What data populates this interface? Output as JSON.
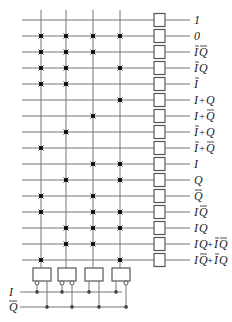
{
  "diagram": {
    "type": "crosspoint-array-function-generator",
    "columns": [
      "c0",
      "c1",
      "c2",
      "c3"
    ],
    "rows": [
      {
        "label": "1",
        "parts": [
          {
            "t": "1"
          }
        ],
        "cross": []
      },
      {
        "label": "0",
        "parts": [
          {
            "t": "0"
          }
        ],
        "cross": [
          0,
          1,
          2,
          3
        ]
      },
      {
        "label": "ĪQ̄",
        "parts": [
          {
            "t": "I",
            "bar": true
          },
          {
            "t": "Q",
            "bar": true
          }
        ],
        "cross": [
          0,
          1,
          2
        ]
      },
      {
        "label": "ĪQ",
        "parts": [
          {
            "t": "I",
            "bar": true
          },
          {
            "t": "Q"
          }
        ],
        "cross": [
          0,
          1,
          3
        ]
      },
      {
        "label": "Ī",
        "parts": [
          {
            "t": "I",
            "bar": true
          }
        ],
        "cross": [
          0,
          1
        ]
      },
      {
        "label": "I+Q",
        "parts": [
          {
            "t": "I"
          },
          {
            "t": "+"
          },
          {
            "t": "Q"
          }
        ],
        "cross": [
          3
        ]
      },
      {
        "label": "I+Q̄",
        "parts": [
          {
            "t": "I"
          },
          {
            "t": "+"
          },
          {
            "t": "Q",
            "bar": true
          }
        ],
        "cross": [
          2
        ]
      },
      {
        "label": "Ī+Q",
        "parts": [
          {
            "t": "I",
            "bar": true
          },
          {
            "t": "+"
          },
          {
            "t": "Q"
          }
        ],
        "cross": [
          1
        ]
      },
      {
        "label": "Ī+Q̄",
        "parts": [
          {
            "t": "I",
            "bar": true
          },
          {
            "t": "+"
          },
          {
            "t": "Q",
            "bar": true
          }
        ],
        "cross": [
          0
        ]
      },
      {
        "label": "I",
        "parts": [
          {
            "t": "I"
          }
        ],
        "cross": [
          2,
          3
        ]
      },
      {
        "label": "Q",
        "parts": [
          {
            "t": "Q"
          }
        ],
        "cross": [
          1,
          3
        ]
      },
      {
        "label": "Q̄",
        "parts": [
          {
            "t": "Q",
            "bar": true
          }
        ],
        "cross": [
          0,
          2
        ]
      },
      {
        "label": "IQ̄",
        "parts": [
          {
            "t": "I"
          },
          {
            "t": "Q",
            "bar": true
          }
        ],
        "cross": [
          0,
          2,
          3
        ]
      },
      {
        "label": "IQ",
        "parts": [
          {
            "t": "I"
          },
          {
            "t": "Q"
          }
        ],
        "cross": [
          1,
          2,
          3
        ]
      },
      {
        "label": "IQ+ĪQ̄",
        "parts": [
          {
            "t": "I"
          },
          {
            "t": "Q"
          },
          {
            "t": "+"
          },
          {
            "t": "I",
            "bar": true
          },
          {
            "t": "Q",
            "bar": true
          }
        ],
        "cross": [
          1,
          2
        ]
      },
      {
        "label": "IQ̄+ĪQ",
        "parts": [
          {
            "t": "I"
          },
          {
            "t": "Q",
            "bar": true
          },
          {
            "t": "+"
          },
          {
            "t": "I",
            "bar": true
          },
          {
            "t": "Q"
          }
        ],
        "cross": [
          0,
          3
        ]
      }
    ],
    "gates": [
      {
        "inputs": [
          {
            "signal": "I",
            "inverted": true
          },
          {
            "signal": "Q",
            "inverted": false
          }
        ]
      },
      {
        "inputs": [
          {
            "signal": "I",
            "inverted": true
          },
          {
            "signal": "Q",
            "inverted": true
          }
        ]
      },
      {
        "inputs": [
          {
            "signal": "I",
            "inverted": false
          },
          {
            "signal": "Q",
            "inverted": false
          }
        ]
      },
      {
        "inputs": [
          {
            "signal": "I",
            "inverted": false
          },
          {
            "signal": "Q",
            "inverted": true
          }
        ]
      }
    ],
    "inputs": [
      {
        "label": "I",
        "bar": false
      },
      {
        "label": "Q",
        "bar": true
      }
    ],
    "colors": {
      "line": "#777777",
      "box": "#555555",
      "cross": "#222222"
    }
  }
}
